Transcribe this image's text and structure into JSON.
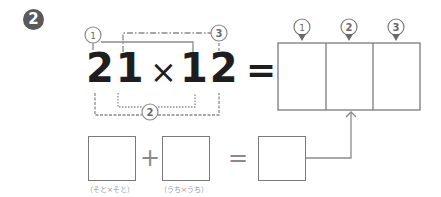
{
  "problem": {
    "number_badge": "2",
    "expression": {
      "left_operand": "21",
      "operator": "×",
      "right_operand": "12",
      "equals": "="
    },
    "bracket_labels": {
      "one": "①",
      "two": "②",
      "three": "③"
    },
    "answer_box": {
      "cell_labels": [
        "①",
        "②",
        "③"
      ],
      "cell_values": [
        "",
        "",
        ""
      ]
    },
    "sub_step": {
      "box1_value": "",
      "plus": "+",
      "box2_value": "",
      "equals": "=",
      "box3_value": "",
      "box1_caption": "（そと×そと）",
      "box2_caption": "（うち×うち）"
    }
  },
  "colors": {
    "badge_bg": "#5a5a5a",
    "digits": "#1e1e1e",
    "lines": "#8a8a8a"
  }
}
